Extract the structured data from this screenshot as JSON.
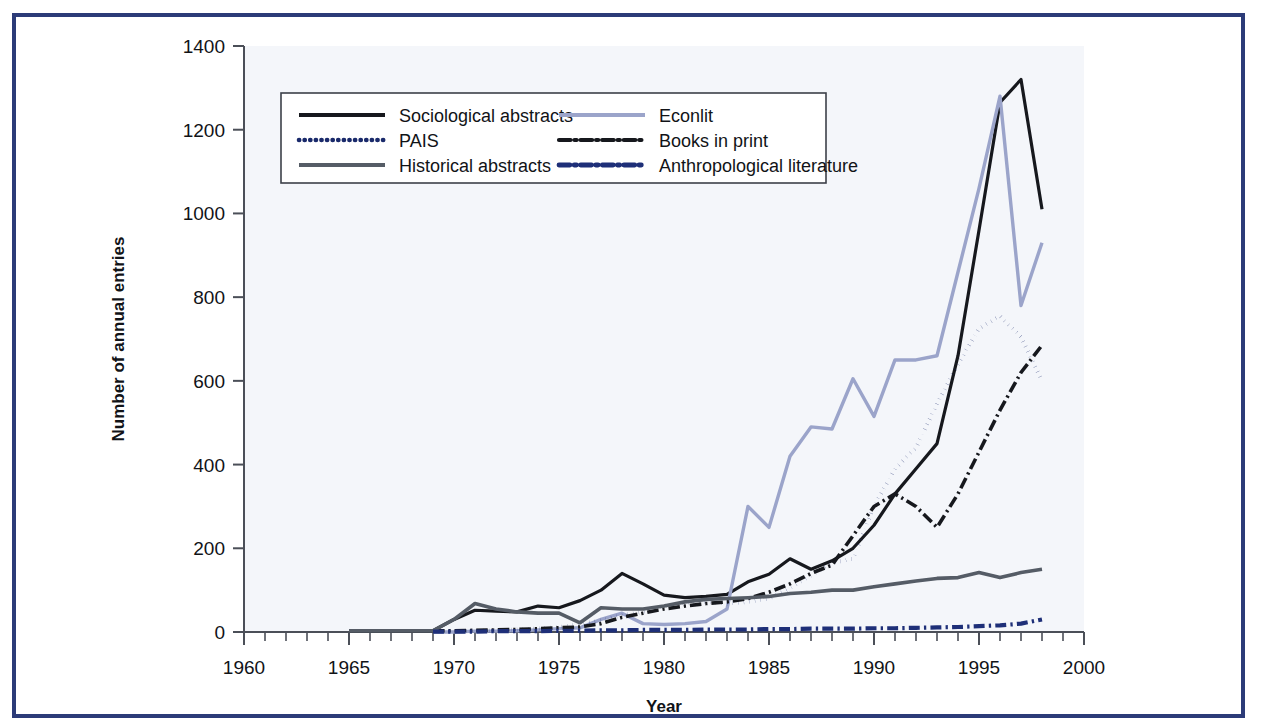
{
  "figure": {
    "frame_color": "#2c3b78",
    "background": "#ffffff",
    "plot_background": "#f4f6fa"
  },
  "chart_data": {
    "type": "line",
    "title": "",
    "xlabel": "Year",
    "ylabel": "Number of annual entries",
    "xlim": [
      1960,
      2000
    ],
    "ylim": [
      0,
      1400
    ],
    "xticks": [
      1960,
      1965,
      1970,
      1975,
      1980,
      1985,
      1990,
      1995,
      2000
    ],
    "xtick_labels": [
      "1960",
      "1965",
      "1970",
      "1975",
      "1980",
      "1985",
      "1990",
      "1995",
      "2000"
    ],
    "x_minor_tick_step": 1,
    "yticks": [
      0,
      200,
      400,
      600,
      800,
      1000,
      1200,
      1400
    ],
    "ytick_labels": [
      "0",
      "200",
      "400",
      "600",
      "800",
      "1000",
      "1200",
      "1400"
    ],
    "grid": false,
    "legend_position": "upper-left-inside",
    "series": [
      {
        "name": "Sociological abstracts",
        "color": "#16181d",
        "style": "solid",
        "width": 3.2,
        "x": [
          1965,
          1966,
          1967,
          1968,
          1969,
          1970,
          1971,
          1972,
          1973,
          1974,
          1975,
          1976,
          1977,
          1978,
          1979,
          1980,
          1981,
          1982,
          1983,
          1984,
          1985,
          1986,
          1987,
          1988,
          1989,
          1990,
          1991,
          1992,
          1993,
          1994,
          1995,
          1996,
          1997,
          1998
        ],
        "y": [
          3,
          3,
          3,
          3,
          3,
          30,
          52,
          50,
          48,
          62,
          58,
          75,
          100,
          140,
          115,
          88,
          82,
          85,
          90,
          120,
          138,
          175,
          150,
          170,
          200,
          255,
          330,
          390,
          450,
          660,
          960,
          1265,
          1320,
          1010
        ]
      },
      {
        "name": "Econlit",
        "color": "#9ba4ca",
        "style": "solid",
        "width": 3.4,
        "x": [
          1969,
          1970,
          1971,
          1972,
          1973,
          1974,
          1975,
          1976,
          1977,
          1978,
          1979,
          1980,
          1981,
          1982,
          1983,
          1984,
          1985,
          1986,
          1987,
          1988,
          1989,
          1990,
          1991,
          1992,
          1993,
          1994,
          1995,
          1996,
          1997,
          1998
        ],
        "y": [
          0,
          0,
          2,
          2,
          3,
          5,
          8,
          10,
          30,
          45,
          20,
          18,
          20,
          25,
          55,
          300,
          250,
          420,
          490,
          485,
          605,
          515,
          650,
          650,
          660,
          860,
          1060,
          1280,
          780,
          930
        ]
      },
      {
        "name": "PAIS",
        "color": "#1a2a6b",
        "style": "dotted",
        "width": 4.0,
        "x": [
          1969,
          1970,
          1971,
          1972,
          1973,
          1974,
          1975,
          1976,
          1977,
          1978,
          1979,
          1980,
          1981,
          1982,
          1983,
          1984,
          1985,
          1986,
          1987,
          1988,
          1989,
          1990,
          1991,
          1992,
          1993,
          1994,
          1995,
          1996,
          1997,
          1998
        ],
        "y": [
          2,
          2,
          3,
          4,
          6,
          8,
          12,
          18,
          28,
          40,
          48,
          62,
          70,
          72,
          68,
          72,
          80,
          105,
          135,
          165,
          175,
          300,
          390,
          440,
          545,
          640,
          725,
          755,
          705,
          600
        ]
      },
      {
        "name": "Books in print",
        "color": "#16181d",
        "style": "dashdot",
        "width": 3.6,
        "x": [
          1969,
          1970,
          1971,
          1972,
          1973,
          1974,
          1975,
          1976,
          1977,
          1978,
          1979,
          1980,
          1981,
          1982,
          1983,
          1984,
          1985,
          1986,
          1987,
          1988,
          1989,
          1990,
          1991,
          1992,
          1993,
          1994,
          1995,
          1996,
          1997,
          1998
        ],
        "y": [
          3,
          3,
          4,
          5,
          6,
          8,
          10,
          12,
          20,
          35,
          45,
          55,
          62,
          68,
          72,
          80,
          95,
          115,
          140,
          160,
          230,
          300,
          330,
          300,
          250,
          330,
          430,
          530,
          620,
          685
        ]
      },
      {
        "name": "Historical abstracts",
        "color": "#555c66",
        "style": "solid",
        "width": 3.6,
        "x": [
          1965,
          1966,
          1967,
          1968,
          1969,
          1970,
          1971,
          1972,
          1973,
          1974,
          1975,
          1976,
          1977,
          1978,
          1979,
          1980,
          1981,
          1982,
          1983,
          1984,
          1985,
          1986,
          1987,
          1988,
          1989,
          1990,
          1991,
          1992,
          1993,
          1994,
          1995,
          1996,
          1997,
          1998
        ],
        "y": [
          3,
          3,
          3,
          3,
          3,
          30,
          68,
          55,
          48,
          45,
          45,
          22,
          58,
          55,
          55,
          62,
          72,
          78,
          80,
          82,
          85,
          92,
          95,
          100,
          100,
          108,
          115,
          122,
          128,
          130,
          142,
          130,
          142,
          150
        ]
      },
      {
        "name": "Anthropological literature",
        "color": "#1e2f78",
        "style": "dashdot-thick",
        "width": 4.2,
        "x": [
          1969,
          1970,
          1971,
          1972,
          1973,
          1974,
          1975,
          1976,
          1977,
          1978,
          1979,
          1980,
          1981,
          1982,
          1983,
          1984,
          1985,
          1986,
          1987,
          1988,
          1989,
          1990,
          1991,
          1992,
          1993,
          1994,
          1995,
          1996,
          1997,
          1998
        ],
        "y": [
          1,
          1,
          1,
          2,
          2,
          2,
          3,
          3,
          4,
          4,
          5,
          5,
          5,
          6,
          6,
          6,
          7,
          7,
          8,
          8,
          8,
          9,
          9,
          10,
          11,
          12,
          14,
          16,
          20,
          30
        ]
      }
    ]
  },
  "legend": {
    "entries": [
      {
        "label": "Sociological abstracts"
      },
      {
        "label": "Econlit"
      },
      {
        "label": "PAIS"
      },
      {
        "label": "Books in print"
      },
      {
        "label": "Historical abstracts"
      },
      {
        "label": "Anthropological literature"
      }
    ]
  }
}
